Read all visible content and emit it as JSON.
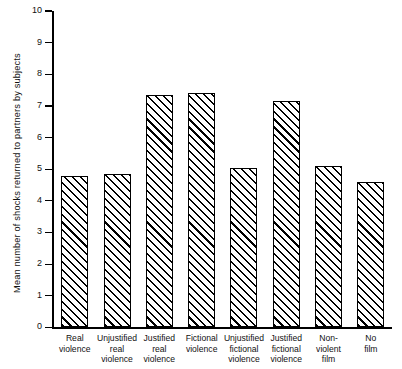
{
  "chart_data": {
    "type": "bar",
    "title": "",
    "xlabel": "",
    "ylabel": "Mean number of shocks returned to partners by subjects",
    "ylim": [
      0,
      10
    ],
    "ytick_step": 1,
    "grid": false,
    "legend": "none",
    "categories": [
      "Real violence",
      "Unjustified real violence",
      "Justified real violence",
      "Fictional violence",
      "Unjustified fictional violence",
      "Justified fictional violence",
      "Non-violent film",
      "No film"
    ],
    "category_lines": [
      [
        "Real",
        "violence"
      ],
      [
        "Unjustified",
        "real",
        "violence"
      ],
      [
        "Justified",
        "real",
        "violence"
      ],
      [
        "Fictional",
        "violence"
      ],
      [
        "Unjustified",
        "fictional",
        "violence"
      ],
      [
        "Justified",
        "fictional",
        "violence"
      ],
      [
        "Non-",
        "violent",
        "film"
      ],
      [
        "No",
        "film"
      ]
    ],
    "values": [
      4.8,
      4.85,
      7.35,
      7.4,
      5.05,
      7.15,
      5.1,
      4.6
    ],
    "ytick_labels": [
      "10",
      "9",
      "8",
      "7",
      "6",
      "5",
      "4",
      "3",
      "2",
      "1",
      "0"
    ],
    "bar_style": {
      "fill": "diagonal-hatch",
      "hatch_angle_deg": 45,
      "edge_color": "#000000",
      "face_color": "#ffffff"
    }
  }
}
